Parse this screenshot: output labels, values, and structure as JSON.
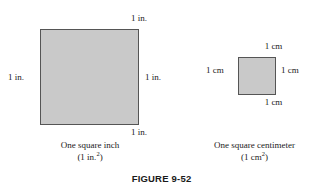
{
  "figure": {
    "number_label": "FIGURE 9-52"
  },
  "panels": [
    {
      "id": "square-inch",
      "unit": "in.",
      "side_labels": {
        "top": "1 in.",
        "right": "1 in.",
        "bottom": "1 in.",
        "left": "1 in."
      },
      "caption_line1": "One square inch",
      "caption_prefix": "(1 in.",
      "caption_exponent": "2",
      "caption_suffix": ")"
    },
    {
      "id": "square-centimeter",
      "unit": "cm",
      "side_labels": {
        "top": "1 cm",
        "right": "1 cm",
        "bottom": "1 cm",
        "left": "1 cm"
      },
      "caption_line1": "One square centimeter",
      "caption_prefix": "(1 cm",
      "caption_exponent": "2",
      "caption_suffix": ")"
    }
  ],
  "colors": {
    "background": "#ffffff",
    "square_fill": "#c9c9c9",
    "square_border": "#555555",
    "text": "#1a1a1a"
  }
}
